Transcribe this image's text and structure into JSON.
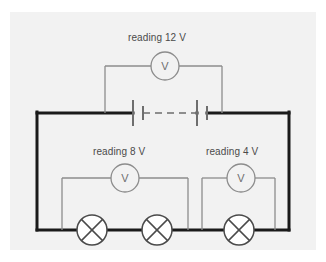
{
  "figure": {
    "kind": "circuit-diagram",
    "title": "",
    "panel_background": "#f2f2f2",
    "page_background": "#ffffff"
  },
  "colors": {
    "main_loop": "#1a1a1a",
    "branch_wire": "#8c8c8c",
    "meter_outline": "#8c8c8c",
    "lamp_outline": "#4a4a4a",
    "battery": "#6e6e6e",
    "text": "#4a4a4a"
  },
  "labels": {
    "top_meter": "reading 12 V",
    "left_meter": "reading 8 V",
    "right_meter": "reading 4 V"
  },
  "meters": [
    {
      "id": "voltmeter-top",
      "symbol": "V",
      "reading": "12 V",
      "label": "reading 12 V",
      "cx": 165,
      "cy": 66,
      "r": 14
    },
    {
      "id": "voltmeter-left",
      "symbol": "V",
      "reading": "8 V",
      "label": "reading 8 V",
      "cx": 125,
      "cy": 178,
      "r": 14
    },
    {
      "id": "voltmeter-right",
      "symbol": "V",
      "reading": "4 V",
      "label": "reading 4 V",
      "cx": 241,
      "cy": 178,
      "r": 14
    }
  ],
  "lamps": [
    {
      "id": "lamp-1",
      "cx": 92,
      "cy": 230,
      "r": 15
    },
    {
      "id": "lamp-2",
      "cx": 157,
      "cy": 230,
      "r": 15
    },
    {
      "id": "lamp-3",
      "cx": 239,
      "cy": 230,
      "r": 15
    }
  ],
  "battery": {
    "id": "battery",
    "cells": 2,
    "cy": 113,
    "long_plate_x": [
      133,
      197
    ],
    "short_plate_x": [
      143,
      207
    ],
    "dashed_span": [
      143,
      197
    ]
  },
  "main_loop": {
    "left_x": 37,
    "right_x": 289,
    "top_y": 113,
    "bottom_y": 230,
    "stroke_width": 3
  },
  "branches": {
    "top": {
      "left_x": 105,
      "right_x": 222,
      "y": 66
    },
    "left": {
      "left_x": 62,
      "right_x": 188,
      "y": 178
    },
    "right": {
      "left_x": 202,
      "right_x": 275,
      "y": 178
    }
  }
}
